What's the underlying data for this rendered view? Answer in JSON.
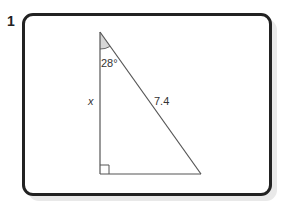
{
  "question": {
    "number": "1"
  },
  "figure": {
    "type": "right triangle",
    "vertices": {
      "apex": [
        100,
        32
      ],
      "right_angle": [
        100,
        174
      ],
      "base_end": [
        201,
        174
      ]
    },
    "labels": {
      "angle": "28°",
      "vertical_side": "x",
      "hypotenuse": "7.4"
    },
    "right_angle_marker": true,
    "angle_shading_color": "#d6d6d6",
    "line_color": "#555555",
    "border_color": "#222222"
  }
}
